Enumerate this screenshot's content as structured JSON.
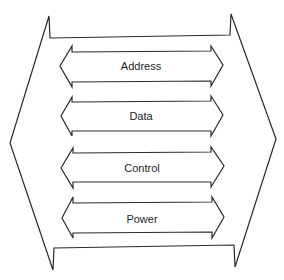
{
  "diagram": {
    "title": "",
    "type": "system bus bundle",
    "stroke_color": "#2a2a2a",
    "text_color": "#1e1e1e",
    "background": "#ffffff",
    "container": {
      "shape": "double-ended chevron bracket enclosing bus lines"
    },
    "buses": [
      {
        "label": "Address",
        "direction": "bidirectional"
      },
      {
        "label": "Data",
        "direction": "bidirectional"
      },
      {
        "label": "Control",
        "direction": "bidirectional"
      },
      {
        "label": "Power",
        "direction": "bidirectional"
      }
    ]
  }
}
